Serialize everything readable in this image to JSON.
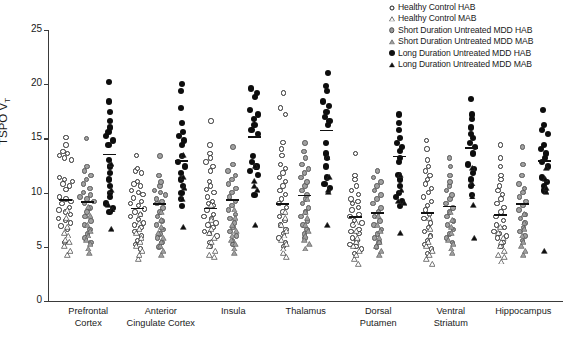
{
  "chart": {
    "type": "scatter",
    "title": "",
    "xlabel": "",
    "ylabel": "TSPO V",
    "ylabel_sub": "T",
    "ylim": [
      0,
      25
    ],
    "yticks": [
      0,
      5,
      10,
      15,
      20,
      25
    ],
    "grid": false,
    "legend_position": "top-right"
  },
  "legend": {
    "items": [
      {
        "label": "Healthy Control HAB",
        "marker": "circle-open",
        "color": "#ffffff"
      },
      {
        "label": "Healthy Control MAB",
        "marker": "triangle-open",
        "color": "#ffffff"
      },
      {
        "label": "Short Duration Untreated MDD HAB",
        "marker": "circle-gray",
        "color": "#a0a0a0"
      },
      {
        "label": "Short Duration Untreated MDD MAB",
        "marker": "triangle-gray",
        "color": "#a0a0a0"
      },
      {
        "label": "Long Duration Untreated MDD HAB",
        "marker": "circle-filled",
        "color": "#0d0d0d"
      },
      {
        "label": "Long Duration Untreated MDD MAB",
        "marker": "triangle-filled",
        "color": "#0d0d0d"
      }
    ]
  },
  "regions": [
    {
      "name": "Prefrontal Cortex",
      "lines": [
        "Prefrontal",
        "Cortex"
      ]
    },
    {
      "name": "Anterior Cingulate Cortex",
      "lines": [
        "Anterior",
        "Cingulate Cortex"
      ]
    },
    {
      "name": "Insula",
      "lines": [
        "Insula"
      ]
    },
    {
      "name": "Thalamus",
      "lines": [
        "Thalamus"
      ]
    },
    {
      "name": "Dorsal Putamen",
      "lines": [
        "Dorsal",
        "Putamen"
      ]
    },
    {
      "name": "Ventral Striatum",
      "lines": [
        "Ventral",
        "Striatum"
      ]
    },
    {
      "name": "Hippocampus",
      "lines": [
        "Hippocampus"
      ]
    }
  ],
  "chart_data": {
    "type": "scatter",
    "ylabel": "TSPO VT",
    "ylim": [
      0,
      25
    ],
    "yticks": [
      0,
      5,
      10,
      15,
      20,
      25
    ],
    "categories": [
      "Prefrontal Cortex",
      "Anterior Cingulate Cortex",
      "Insula",
      "Thalamus",
      "Dorsal Putamen",
      "Ventral Striatum",
      "Hippocampus"
    ],
    "series": [
      {
        "name": "Healthy Control HAB",
        "marker": "circle-open",
        "values_by_region": {
          "Prefrontal Cortex": [
            15.1,
            14.4,
            13.8,
            13.6,
            13.4,
            13.2,
            13.0,
            11.4,
            11.2,
            11.0,
            10.8,
            10.6,
            10.3,
            9.6,
            9.4,
            9.2,
            9.0,
            8.6,
            8.4,
            8.2,
            8.0,
            7.6,
            7.4,
            7.2,
            6.9,
            6.6,
            5.4
          ],
          "Anterior Cingulate Cortex": [
            13.4,
            12.2,
            12.0,
            11.8,
            11.0,
            10.8,
            10.6,
            10.2,
            10.0,
            9.8,
            9.5,
            9.2,
            9.0,
            8.8,
            8.5,
            8.2,
            8.0,
            7.8,
            7.5,
            7.2,
            7.0,
            6.8,
            6.4,
            6.0,
            5.6,
            5.2,
            4.8
          ],
          "Insula": [
            16.6,
            14.4,
            13.6,
            13.2,
            12.8,
            12.4,
            12.0,
            11.0,
            10.6,
            10.3,
            10.0,
            9.6,
            9.2,
            9.0,
            8.8,
            8.4,
            8.0,
            7.8,
            7.6,
            7.2,
            7.0,
            6.8,
            6.4,
            6.2,
            6.0,
            5.4,
            5.0
          ],
          "Thalamus": [
            19.2,
            17.8,
            17.2,
            14.6,
            14.0,
            13.4,
            12.6,
            12.2,
            11.8,
            11.4,
            11.0,
            10.6,
            10.2,
            9.8,
            9.4,
            9.0,
            8.6,
            8.2,
            7.8,
            7.4,
            7.0,
            6.6,
            6.2,
            5.8,
            5.4,
            5.0
          ],
          "Dorsal Putamen": [
            13.6,
            11.6,
            11.2,
            10.6,
            10.2,
            9.8,
            9.4,
            9.2,
            9.0,
            8.6,
            8.4,
            8.0,
            7.8,
            7.4,
            7.2,
            7.0,
            6.6,
            6.4,
            6.2,
            5.8,
            5.6,
            5.2,
            5.0,
            4.8,
            4.4
          ],
          "Ventral Striatum": [
            14.8,
            14.0,
            13.0,
            12.4,
            12.0,
            11.6,
            11.2,
            10.8,
            10.4,
            10.0,
            9.6,
            9.2,
            8.8,
            8.4,
            8.0,
            7.6,
            7.2,
            6.8,
            6.4,
            6.0,
            5.6,
            5.2,
            4.8,
            4.4
          ],
          "Hippocampus": [
            14.4,
            13.2,
            12.4,
            11.6,
            11.2,
            10.6,
            10.2,
            9.8,
            9.4,
            9.0,
            8.6,
            8.2,
            7.8,
            7.4,
            7.0,
            6.8,
            6.4,
            6.2,
            6.0,
            5.8,
            5.4,
            5.0
          ]
        }
      },
      {
        "name": "Healthy Control MAB",
        "marker": "triangle-open",
        "values_by_region": {
          "Prefrontal Cortex": [
            9.2,
            8.4,
            7.6,
            7.0,
            6.8,
            6.4,
            6.2,
            5.8,
            5.4,
            5.0
          ],
          "Anterior Cingulate Cortex": [
            8.8,
            8.0,
            7.4,
            7.0,
            6.6,
            6.2,
            5.8,
            5.4,
            5.0,
            4.6
          ],
          "Insula": [
            9.6,
            8.2,
            7.4,
            7.0,
            6.6,
            6.2,
            5.8,
            5.4,
            5.0,
            4.8
          ],
          "Thalamus": [
            9.0,
            8.4,
            7.8,
            7.2,
            6.8,
            6.4,
            6.0,
            5.6,
            5.2,
            4.8
          ],
          "Dorsal Putamen": [
            8.0,
            7.2,
            6.6,
            6.2,
            5.8,
            5.4,
            5.0,
            4.6,
            4.2
          ],
          "Ventral Striatum": [
            8.4,
            7.4,
            6.8,
            6.2,
            5.8,
            5.4,
            5.0,
            4.6,
            4.2
          ],
          "Hippocampus": [
            7.6,
            7.0,
            6.6,
            6.2,
            5.8,
            5.4,
            5.0,
            4.8,
            4.4
          ]
        }
      },
      {
        "name": "Short Duration Untreated MDD HAB",
        "marker": "circle-gray",
        "values_by_region": {
          "Prefrontal Cortex": [
            15.0,
            12.4,
            12.0,
            11.6,
            11.2,
            10.8,
            10.4,
            10.0,
            9.8,
            9.6,
            9.4,
            9.2,
            9.0,
            8.6,
            8.2,
            7.8,
            7.4,
            7.0,
            6.6,
            6.2,
            5.8,
            5.4
          ],
          "Anterior Cingulate Cortex": [
            13.4,
            11.6,
            11.0,
            10.6,
            10.2,
            10.0,
            9.8,
            9.4,
            9.2,
            9.0,
            8.6,
            8.2,
            7.8,
            7.4,
            7.0,
            6.6,
            6.2,
            5.8,
            5.4,
            5.0
          ],
          "Insula": [
            14.2,
            12.6,
            12.0,
            11.6,
            11.2,
            10.8,
            10.4,
            10.0,
            9.6,
            9.2,
            8.8,
            8.4,
            8.0,
            7.6,
            7.2,
            6.8,
            6.4,
            6.0,
            5.6,
            5.2
          ],
          "Thalamus": [
            14.6,
            13.8,
            13.2,
            12.6,
            12.2,
            11.8,
            11.4,
            11.0,
            10.6,
            10.2,
            9.8,
            9.4,
            9.0,
            8.6,
            8.2,
            7.8,
            7.4,
            7.0,
            6.6,
            6.2,
            5.8
          ],
          "Dorsal Putamen": [
            12.0,
            11.4,
            11.0,
            10.6,
            10.2,
            9.8,
            9.4,
            9.0,
            8.6,
            8.2,
            7.8,
            7.4,
            7.0,
            6.6,
            6.2,
            5.8,
            5.4,
            5.0
          ],
          "Ventral Striatum": [
            13.2,
            12.4,
            11.6,
            11.0,
            10.6,
            10.2,
            9.8,
            9.4,
            9.0,
            8.6,
            8.2,
            7.8,
            7.4,
            7.0,
            6.6,
            6.2,
            5.8,
            5.4
          ],
          "Hippocampus": [
            14.2,
            12.6,
            11.6,
            10.8,
            10.4,
            10.0,
            9.6,
            9.2,
            8.8,
            8.4,
            8.0,
            7.6,
            7.2,
            6.8,
            6.4,
            6.0,
            5.6
          ]
        }
      },
      {
        "name": "Short Duration Untreated MDD MAB",
        "marker": "triangle-gray",
        "values_by_region": {
          "Prefrontal Cortex": [
            9.4,
            8.6,
            7.8,
            7.2,
            6.8,
            6.4,
            6.0,
            5.6,
            5.2
          ],
          "Anterior Cingulate Cortex": [
            9.0,
            8.2,
            7.6,
            7.0,
            6.6,
            6.2,
            5.8,
            5.4,
            5.0
          ],
          "Insula": [
            9.2,
            8.4,
            7.8,
            7.2,
            6.8,
            6.4,
            6.0,
            5.6,
            5.2
          ],
          "Thalamus": [
            10.2,
            9.0,
            8.4,
            7.8,
            7.2,
            6.8,
            6.4,
            6.0,
            5.6
          ],
          "Dorsal Putamen": [
            8.6,
            7.8,
            7.2,
            6.6,
            6.2,
            5.8,
            5.4,
            5.0
          ],
          "Ventral Striatum": [
            9.0,
            8.2,
            7.6,
            7.0,
            6.4,
            6.0,
            5.6,
            5.2
          ],
          "Hippocampus": [
            8.8,
            8.0,
            7.4,
            6.8,
            6.2,
            5.8,
            5.4,
            5.0
          ]
        }
      },
      {
        "name": "Long Duration Untreated MDD HAB",
        "marker": "circle-filled",
        "values_by_region": {
          "Prefrontal Cortex": [
            20.2,
            18.4,
            17.4,
            16.6,
            16.0,
            15.6,
            15.2,
            14.8,
            14.4,
            13.0,
            12.4,
            11.8,
            11.2,
            10.6,
            10.0,
            9.6,
            9.0,
            8.6,
            8.2
          ],
          "Anterior Cingulate Cortex": [
            20.0,
            19.4,
            17.8,
            16.4,
            15.6,
            15.2,
            14.8,
            14.4,
            13.4,
            12.8,
            12.4,
            11.8,
            11.2,
            10.6,
            10.0,
            9.4,
            8.8
          ],
          "Insula": [
            19.6,
            19.2,
            18.8,
            17.6,
            17.2,
            16.8,
            16.2,
            15.8,
            15.4,
            13.4,
            12.8,
            12.4,
            12.0,
            11.6,
            9.8
          ],
          "Thalamus": [
            21.0,
            19.8,
            19.4,
            18.4,
            18.0,
            17.4,
            17.0,
            16.6,
            16.2,
            14.6,
            13.6,
            13.2,
            12.4,
            11.4,
            10.8,
            10.4
          ],
          "Dorsal Putamen": [
            17.2,
            16.4,
            15.8,
            15.0,
            14.6,
            14.2,
            13.8,
            13.2,
            12.8,
            11.6,
            11.2,
            10.6,
            10.0,
            9.6,
            9.2,
            8.8
          ],
          "Ventral Striatum": [
            18.6,
            17.2,
            16.8,
            16.0,
            15.4,
            15.0,
            14.6,
            14.2,
            13.6,
            12.6,
            12.2,
            11.8,
            11.2,
            10.6,
            9.8
          ],
          "Hippocampus": [
            17.6,
            16.2,
            15.8,
            15.4,
            14.4,
            14.0,
            13.6,
            13.2,
            12.8,
            12.4,
            11.4,
            11.0,
            10.6,
            10.2
          ]
        }
      },
      {
        "name": "Long Duration Untreated MDD MAB",
        "marker": "triangle-filled",
        "values_by_region": {
          "Prefrontal Cortex": [
            13.4,
            11.0,
            9.6,
            9.2,
            7.4
          ],
          "Anterior Cingulate Cortex": [
            14.2,
            12.2,
            11.2,
            10.2,
            7.6
          ],
          "Insula": [
            13.2,
            11.8,
            11.4,
            11.0,
            7.8
          ],
          "Thalamus": [
            14.0,
            12.2,
            11.0,
            10.8,
            7.8
          ],
          "Dorsal Putamen": [
            12.4,
            11.0,
            10.0,
            9.8,
            7.0
          ],
          "Ventral Striatum": [
            13.0,
            11.6,
            10.4,
            9.6,
            6.6
          ],
          "Hippocampus": [
            13.0,
            12.0,
            11.2,
            10.8,
            5.4
          ]
        }
      }
    ],
    "median_markers": [
      {
        "region": "Prefrontal Cortex",
        "group": "Healthy Control HAB",
        "value": 9.4
      },
      {
        "region": "Prefrontal Cortex",
        "group": "Short Duration Untreated MDD HAB",
        "value": 9.2
      },
      {
        "region": "Prefrontal Cortex",
        "group": "Long Duration Untreated MDD HAB",
        "value": 13.6
      },
      {
        "region": "Anterior Cingulate Cortex",
        "group": "Healthy Control HAB",
        "value": 8.6
      },
      {
        "region": "Anterior Cingulate Cortex",
        "group": "Short Duration Untreated MDD HAB",
        "value": 9.0
      },
      {
        "region": "Anterior Cingulate Cortex",
        "group": "Long Duration Untreated MDD HAB",
        "value": 13.0
      },
      {
        "region": "Insula",
        "group": "Healthy Control HAB",
        "value": 8.6
      },
      {
        "region": "Insula",
        "group": "Short Duration Untreated MDD HAB",
        "value": 9.4
      },
      {
        "region": "Insula",
        "group": "Long Duration Untreated MDD HAB",
        "value": 15.2
      },
      {
        "region": "Thalamus",
        "group": "Healthy Control HAB",
        "value": 9.0
      },
      {
        "region": "Thalamus",
        "group": "Short Duration Untreated MDD HAB",
        "value": 9.8
      },
      {
        "region": "Thalamus",
        "group": "Long Duration Untreated MDD HAB",
        "value": 15.8
      },
      {
        "region": "Dorsal Putamen",
        "group": "Healthy Control HAB",
        "value": 7.8
      },
      {
        "region": "Dorsal Putamen",
        "group": "Short Duration Untreated MDD HAB",
        "value": 8.2
      },
      {
        "region": "Dorsal Putamen",
        "group": "Long Duration Untreated MDD HAB",
        "value": 13.4
      },
      {
        "region": "Ventral Striatum",
        "group": "Healthy Control HAB",
        "value": 8.2
      },
      {
        "region": "Ventral Striatum",
        "group": "Short Duration Untreated MDD HAB",
        "value": 8.8
      },
      {
        "region": "Ventral Striatum",
        "group": "Long Duration Untreated MDD HAB",
        "value": 14.2
      },
      {
        "region": "Hippocampus",
        "group": "Healthy Control HAB",
        "value": 8.0
      },
      {
        "region": "Hippocampus",
        "group": "Short Duration Untreated MDD HAB",
        "value": 9.0
      },
      {
        "region": "Hippocampus",
        "group": "Long Duration Untreated MDD HAB",
        "value": 13.0
      }
    ]
  }
}
